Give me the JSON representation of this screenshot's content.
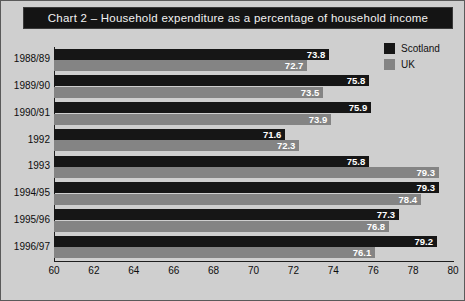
{
  "title": "Chart 2 – Household expenditure as a percentage of household income",
  "legend": {
    "items": [
      {
        "label": "Scotland",
        "color": "#161616",
        "swatch_icon": "legend-swatch-scotland"
      },
      {
        "label": "UK",
        "color": "#848484",
        "swatch_icon": "legend-swatch-uk"
      }
    ]
  },
  "caption": "",
  "chart_data": {
    "type": "bar",
    "orientation": "horizontal",
    "title": "Chart 2 – Household expenditure as a percentage of household income",
    "xlabel": "",
    "ylabel": "",
    "xlim": [
      60,
      80
    ],
    "xticks": [
      60,
      62,
      64,
      66,
      68,
      70,
      72,
      74,
      76,
      78,
      80
    ],
    "grid": false,
    "legend_position": "top-right",
    "categories": [
      "1988/89",
      "1989/90",
      "1990/91",
      "1992",
      "1993",
      "1994/95",
      "1995/96",
      "1996/97"
    ],
    "series": [
      {
        "name": "Scotland",
        "color": "#161616",
        "values": [
          73.8,
          75.8,
          75.9,
          71.6,
          75.8,
          79.3,
          77.3,
          79.2
        ]
      },
      {
        "name": "UK",
        "color": "#848484",
        "values": [
          72.7,
          73.5,
          73.9,
          72.3,
          79.3,
          78.4,
          76.8,
          76.1
        ]
      }
    ]
  }
}
